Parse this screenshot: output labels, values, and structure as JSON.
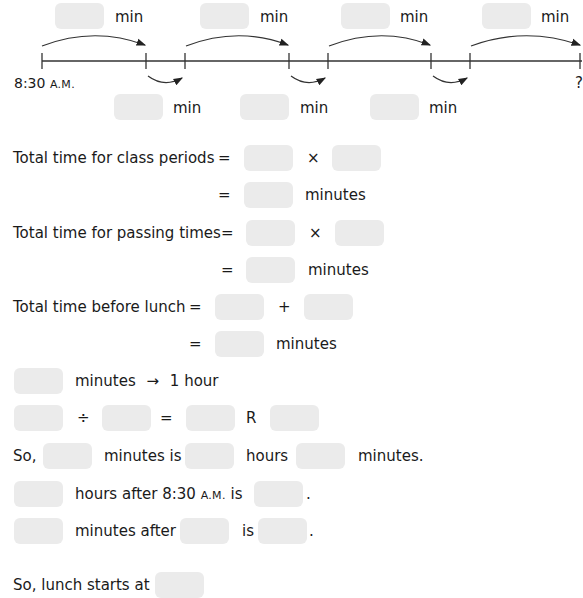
{
  "number_line": {
    "start_label": "8:30",
    "start_suffix": "A.M.",
    "end_label": "?",
    "top_unit": "min",
    "bottom_unit": "min",
    "top_blanks": 4,
    "bottom_blanks": 3
  },
  "lines": {
    "class_periods": {
      "label": "Total time for class periods",
      "eq": "=",
      "op": "×",
      "unit": "minutes"
    },
    "passing_times": {
      "label": "Total time for passing times",
      "eq": "=",
      "op": "×",
      "unit": "minutes"
    },
    "before_lunch": {
      "label": "Total time before lunch",
      "eq": "=",
      "op": "+",
      "unit": "minutes"
    },
    "conversion": {
      "text": "minutes",
      "arrow": "→",
      "result": "1 hour"
    },
    "division": {
      "div": "÷",
      "eq": "=",
      "remainder": "R"
    },
    "so_line": {
      "so": "So,",
      "minutes_is": "minutes is",
      "hours": "hours",
      "minutes": "minutes."
    },
    "hours_after": {
      "text": "hours after 8:30",
      "suffix": "A.M.",
      "is": "is",
      "period": "."
    },
    "minutes_after": {
      "text": "minutes after",
      "is": "is",
      "period": "."
    },
    "lunch_line": {
      "text": "So, lunch starts at"
    }
  }
}
